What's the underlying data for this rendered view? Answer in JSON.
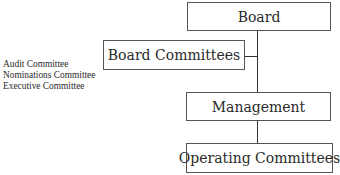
{
  "diagram": {
    "nodes": {
      "board": {
        "label": "Board"
      },
      "board_committees": {
        "label": "Board Committees"
      },
      "management": {
        "label": "Management"
      },
      "operating_committees": {
        "label": "Operating Committees"
      }
    },
    "committee_list": [
      "Audit Committee",
      "Nominations Committee",
      "Executive Committee"
    ],
    "edges": [
      {
        "from": "board",
        "to": "management"
      },
      {
        "from": "board",
        "to": "board_committees"
      },
      {
        "from": "management",
        "to": "operating_committees"
      }
    ]
  }
}
